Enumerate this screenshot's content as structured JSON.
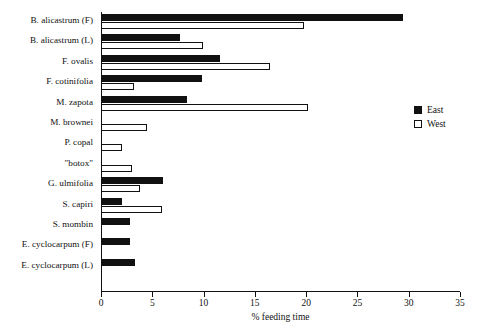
{
  "chart_data": {
    "type": "bar",
    "orientation": "horizontal",
    "title": "",
    "xlabel": "% feeding time",
    "ylabel": "",
    "xlim": [
      0,
      35
    ],
    "xticks": [
      0,
      5,
      10,
      15,
      20,
      25,
      30,
      35
    ],
    "grid": false,
    "legend_position": "right",
    "categories": [
      "B. alicastrum (F)",
      "B. alicastrum (L)",
      "F. ovalis",
      "F. cotinifolia",
      "M. zapota",
      "M. brownei",
      "P. copal",
      "\"botox\"",
      "G. ulmifolia",
      "S. capiri",
      "S. mombin",
      "E. cyclocarpum (F)",
      "E. cyclocarpum (L)"
    ],
    "series": [
      {
        "name": "East",
        "color": "#111111",
        "values": [
          29.4,
          7.7,
          11.6,
          9.8,
          8.4,
          0,
          0,
          0,
          6.0,
          2.0,
          2.8,
          2.8,
          3.3
        ]
      },
      {
        "name": "West",
        "color": "#ffffff",
        "values": [
          19.8,
          9.9,
          16.5,
          3.2,
          20.2,
          4.5,
          2.0,
          3.0,
          3.8,
          5.9,
          0,
          0,
          0
        ]
      }
    ]
  },
  "legend": {
    "entries": [
      {
        "label": "East",
        "swatch": "filled-square"
      },
      {
        "label": "West",
        "swatch": "open-square"
      }
    ]
  }
}
